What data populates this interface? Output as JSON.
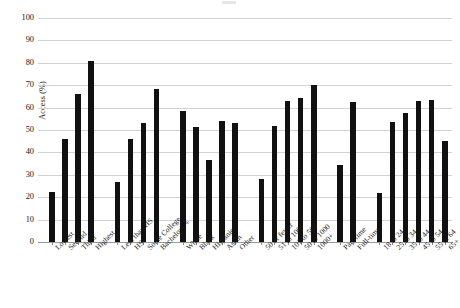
{
  "chart_data": {
    "type": "bar",
    "title": "",
    "xlabel": "",
    "ylabel": "Access (%)",
    "ylim": [
      0,
      100
    ],
    "yticks": [
      0,
      10,
      20,
      30,
      40,
      50,
      60,
      70,
      80,
      90,
      100
    ],
    "grid": true,
    "legend": "none",
    "bar_color": "#111111",
    "categories": [
      "Lowest",
      "Second",
      "Third",
      "Highest",
      "Less than HS",
      "HS",
      "Some College",
      "Bachelor's +",
      "White",
      "Black",
      "Hispanic",
      "Asian",
      "Other",
      "50 or fewer",
      "51 to 100",
      "101 to 500",
      "50 to 1000",
      "1000+",
      "Part-time",
      "Full-time",
      "18 to 24",
      "25 to 34",
      "35 to 44",
      "45 to 54",
      "55 to 64",
      "65+"
    ],
    "values": [
      22.5,
      46.0,
      66.0,
      81.0,
      27.0,
      46.0,
      53.0,
      68.5,
      58.5,
      51.5,
      36.5,
      54.0,
      53.0,
      28.0,
      52.0,
      63.0,
      64.5,
      70.0,
      34.5,
      62.5,
      22.0,
      53.5,
      57.5,
      63.0,
      63.5,
      45.0
    ],
    "groups": [
      {
        "name": "Income quartile",
        "start": 0,
        "count": 4
      },
      {
        "name": "Education",
        "start": 4,
        "count": 4
      },
      {
        "name": "Race / ethnicity",
        "start": 8,
        "count": 5
      },
      {
        "name": "Firm size",
        "start": 13,
        "count": 5
      },
      {
        "name": "Work status",
        "start": 18,
        "count": 2
      },
      {
        "name": "Age",
        "start": 20,
        "count": 6
      }
    ]
  }
}
